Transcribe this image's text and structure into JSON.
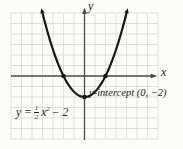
{
  "colors": {
    "background": "#fcfcf9",
    "grid": "#d6d6d3",
    "axis": "#4c4c4c",
    "curve": "#171717",
    "text": "#222222"
  },
  "labels": {
    "x_axis": "x",
    "y_axis": "y",
    "annotation": "y-intercept (0, −2)",
    "equation": {
      "lhs": "y =",
      "numerator": "1",
      "denominator": "2",
      "variable": "x",
      "exponent": "2",
      "tail": "− 2"
    }
  },
  "chart_data": {
    "type": "line",
    "title": "",
    "xlabel": "x",
    "ylabel": "y",
    "function": {
      "form": "quadratic",
      "a": 0.5,
      "b": 0,
      "c": -2,
      "expression": "y = (1/2)x^2 - 2"
    },
    "x_range_drawn": [
      -4.0,
      4.0
    ],
    "xlim": [
      -7,
      7
    ],
    "ylim": [
      -6,
      6
    ],
    "grid": true,
    "key_points": [
      {
        "label": "x-intercept",
        "x": -2,
        "y": 0
      },
      {
        "label": "x-intercept",
        "x": 2,
        "y": 0
      },
      {
        "label": "y-intercept",
        "x": 0,
        "y": -2
      }
    ],
    "annotation": {
      "text": "y-intercept (0, −2)",
      "points_to": {
        "x": 0,
        "y": -2
      }
    }
  }
}
